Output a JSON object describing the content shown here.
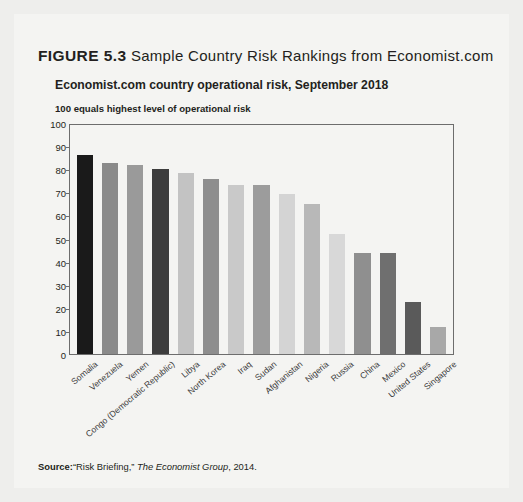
{
  "figure": {
    "number_label": "FIGURE 5.3",
    "title": "Sample Country Risk Rankings from Economist.com",
    "subtitle": "Economist.com country operational risk, September 2018",
    "note": "100 equals highest level of operational risk"
  },
  "source": {
    "label": "Source:",
    "citation_part1": "“Risk Briefing,” ",
    "citation_italic": "The Economist Group",
    "citation_part2": ", 2014."
  },
  "chart_data": {
    "type": "bar",
    "title": "Economist.com country operational risk, September 2018",
    "subtitle": "100 equals highest level of operational risk",
    "xlabel": "",
    "ylabel": "",
    "ylim": [
      0,
      100
    ],
    "yticks": [
      100,
      90,
      80,
      70,
      60,
      50,
      40,
      30,
      20,
      10,
      0
    ],
    "grid": false,
    "legend": "none",
    "categories": [
      "Somalia",
      "Venezuela",
      "Yemen",
      "Congo (Democratic Republic)",
      "Libya",
      "North Korea",
      "Iraq",
      "Sudan",
      "Afghanistan",
      "Nigeria",
      "Russia",
      "China",
      "Mexico",
      "United States",
      "Singapore"
    ],
    "values": [
      87,
      83.5,
      82.5,
      81,
      79,
      76.5,
      74,
      74,
      70,
      65.5,
      52.5,
      44,
      44,
      22.5,
      12
    ],
    "bar_colors": [
      "#1a1a1a",
      "#8a8a8a",
      "#9a9a9a",
      "#3d3d3d",
      "#c3c3c3",
      "#8e8e8e",
      "#c9c9c9",
      "#9c9c9c",
      "#d4d4d4",
      "#b8b8b8",
      "#d8d8d8",
      "#8f8f8f",
      "#6f6f6f",
      "#5a5a5a",
      "#a8a8a8"
    ]
  },
  "colors": {
    "page_background": "#eeeeec",
    "card_background": "#f4f4f2",
    "axis": "#6d6d6d",
    "text": "#231f20"
  }
}
